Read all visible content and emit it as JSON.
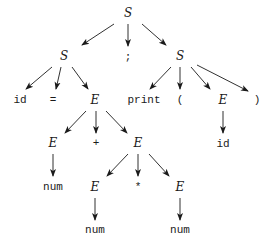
{
  "diagram": {
    "type": "parse-tree",
    "nodes": [
      {
        "id": "n0",
        "label": "S",
        "kind": "nonterminal",
        "x": 128,
        "y": 13
      },
      {
        "id": "n1",
        "label": "S",
        "kind": "nonterminal",
        "x": 64,
        "y": 56
      },
      {
        "id": "n2",
        "label": ";",
        "kind": "terminal",
        "x": 128,
        "y": 57
      },
      {
        "id": "n3",
        "label": "S",
        "kind": "nonterminal",
        "x": 180,
        "y": 56
      },
      {
        "id": "n4",
        "label": "id",
        "kind": "terminal",
        "x": 20,
        "y": 100
      },
      {
        "id": "n5",
        "label": "=",
        "kind": "terminal",
        "x": 53,
        "y": 100
      },
      {
        "id": "n6",
        "label": "E",
        "kind": "nonterminal",
        "x": 95,
        "y": 100
      },
      {
        "id": "n7",
        "label": "print",
        "kind": "terminal",
        "x": 144,
        "y": 100
      },
      {
        "id": "n8",
        "label": "(",
        "kind": "terminal",
        "x": 180,
        "y": 100
      },
      {
        "id": "n9",
        "label": "E",
        "kind": "nonterminal",
        "x": 223,
        "y": 100
      },
      {
        "id": "n10",
        "label": ")",
        "kind": "terminal",
        "x": 257,
        "y": 100
      },
      {
        "id": "n11",
        "label": "E",
        "kind": "nonterminal",
        "x": 53,
        "y": 143
      },
      {
        "id": "n12",
        "label": "+",
        "kind": "terminal",
        "x": 96,
        "y": 143
      },
      {
        "id": "n13",
        "label": "E",
        "kind": "nonterminal",
        "x": 138,
        "y": 143
      },
      {
        "id": "n14",
        "label": "id",
        "kind": "terminal",
        "x": 223,
        "y": 144
      },
      {
        "id": "n15",
        "label": "num",
        "kind": "terminal",
        "x": 53,
        "y": 187
      },
      {
        "id": "n16",
        "label": "E",
        "kind": "nonterminal",
        "x": 95,
        "y": 187
      },
      {
        "id": "n17",
        "label": "*",
        "kind": "terminal",
        "x": 138,
        "y": 187
      },
      {
        "id": "n18",
        "label": "E",
        "kind": "nonterminal",
        "x": 180,
        "y": 187
      },
      {
        "id": "n19",
        "label": "num",
        "kind": "terminal",
        "x": 95,
        "y": 230
      },
      {
        "id": "n20",
        "label": "num",
        "kind": "terminal",
        "x": 180,
        "y": 230
      }
    ],
    "edges": [
      {
        "from": [
          114,
          24
        ],
        "to": [
          82,
          45
        ]
      },
      {
        "from": [
          128,
          24
        ],
        "to": [
          128,
          46
        ]
      },
      {
        "from": [
          142,
          24
        ],
        "to": [
          166,
          45
        ]
      },
      {
        "from": [
          52,
          67
        ],
        "to": [
          26,
          89
        ]
      },
      {
        "from": [
          61,
          67
        ],
        "to": [
          56,
          89
        ]
      },
      {
        "from": [
          72,
          67
        ],
        "to": [
          88,
          89
        ]
      },
      {
        "from": [
          171,
          67
        ],
        "to": [
          150,
          89
        ]
      },
      {
        "from": [
          180,
          67
        ],
        "to": [
          180,
          89
        ]
      },
      {
        "from": [
          191,
          67
        ],
        "to": [
          210,
          89
        ]
      },
      {
        "from": [
          197,
          65
        ],
        "to": [
          248,
          91
        ]
      },
      {
        "from": [
          86,
          111
        ],
        "to": [
          65,
          133
        ]
      },
      {
        "from": [
          96,
          111
        ],
        "to": [
          96,
          133
        ]
      },
      {
        "from": [
          106,
          111
        ],
        "to": [
          127,
          133
        ]
      },
      {
        "from": [
          223,
          111
        ],
        "to": [
          223,
          133
        ]
      },
      {
        "from": [
          53,
          154
        ],
        "to": [
          53,
          176
        ]
      },
      {
        "from": [
          128,
          154
        ],
        "to": [
          107,
          176
        ]
      },
      {
        "from": [
          138,
          154
        ],
        "to": [
          138,
          176
        ]
      },
      {
        "from": [
          149,
          154
        ],
        "to": [
          169,
          176
        ]
      },
      {
        "from": [
          95,
          198
        ],
        "to": [
          95,
          220
        ]
      },
      {
        "from": [
          180,
          198
        ],
        "to": [
          180,
          220
        ]
      }
    ],
    "colors": {
      "line": "#1a1a1a",
      "background": "#ffffff"
    }
  }
}
